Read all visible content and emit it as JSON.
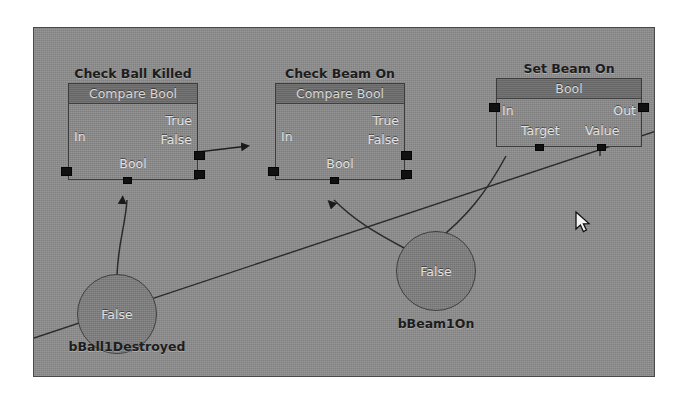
{
  "canvas": {
    "background_color": "#8e8e8e",
    "border_color": "#4a4a4a"
  },
  "nodes": [
    {
      "id": "check-ball-killed",
      "caption": "Check Ball Killed",
      "title": "Compare Bool",
      "pins": {
        "in": "In",
        "true": "True",
        "false": "False",
        "type": "Bool"
      }
    },
    {
      "id": "check-beam-on",
      "caption": "Check Beam On",
      "title": "Compare Bool",
      "pins": {
        "in": "In",
        "true": "True",
        "false": "False",
        "type": "Bool"
      }
    },
    {
      "id": "set-beam-on",
      "caption": "Set Beam On",
      "title": "Bool",
      "pins": {
        "in": "In",
        "out": "Out",
        "target": "Target",
        "value": "Value"
      }
    }
  ],
  "variables": [
    {
      "id": "bball1destroyed",
      "value": "False",
      "caption": "bBall1Destroyed"
    },
    {
      "id": "bbeam1on",
      "value": "False",
      "caption": "bBeam1On"
    }
  ],
  "cursor": {
    "icon": "arrow-pointer",
    "x": 575,
    "y": 211
  }
}
